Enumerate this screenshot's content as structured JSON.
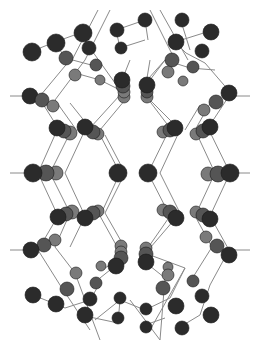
{
  "diagram": {
    "type": "ball-and-stick crystal lattice",
    "width": 255,
    "height": 349,
    "colors": {
      "background": "#ffffff",
      "bond": "#8a8a8a",
      "atom_dark": "#2b2b2b",
      "atom_mid": "#555555",
      "atom_light": "#7a7a7a",
      "atom_stroke": "#1a1a1a"
    },
    "bond_width": 1,
    "bonds": [
      [
        10,
        96,
        38,
        96
      ],
      [
        229,
        96,
        250,
        96
      ],
      [
        10,
        173,
        35,
        173
      ],
      [
        225,
        173,
        250,
        173
      ],
      [
        10,
        250,
        38,
        250
      ],
      [
        229,
        250,
        250,
        250
      ],
      [
        98,
        10,
        72,
        60
      ],
      [
        110,
        10,
        85,
        60
      ],
      [
        150,
        10,
        175,
        60
      ],
      [
        160,
        10,
        188,
        60
      ],
      [
        30,
        52,
        55,
        42
      ],
      [
        55,
        42,
        80,
        33
      ],
      [
        55,
        42,
        65,
        58
      ],
      [
        80,
        33,
        90,
        48
      ],
      [
        65,
        58,
        95,
        66
      ],
      [
        90,
        48,
        120,
        90
      ],
      [
        75,
        73,
        100,
        80
      ],
      [
        100,
        80,
        120,
        90
      ],
      [
        116,
        30,
        145,
        20
      ],
      [
        145,
        20,
        148,
        40
      ],
      [
        116,
        30,
        120,
        48
      ],
      [
        120,
        48,
        145,
        40
      ],
      [
        180,
        18,
        190,
        50
      ],
      [
        175,
        42,
        210,
        31
      ],
      [
        175,
        42,
        186,
        53
      ],
      [
        186,
        53,
        205,
        63
      ],
      [
        205,
        63,
        230,
        92
      ],
      [
        165,
        60,
        190,
        68
      ],
      [
        190,
        68,
        215,
        70
      ],
      [
        165,
        60,
        140,
        88
      ],
      [
        150,
        80,
        165,
        60
      ],
      [
        70,
        60,
        40,
        96
      ],
      [
        85,
        60,
        55,
        100
      ],
      [
        130,
        60,
        118,
        90
      ],
      [
        150,
        60,
        145,
        90
      ],
      [
        38,
        96,
        58,
        128
      ],
      [
        55,
        100,
        75,
        128
      ],
      [
        70,
        103,
        90,
        128
      ],
      [
        120,
        95,
        90,
        128
      ],
      [
        125,
        100,
        100,
        130
      ],
      [
        145,
        95,
        170,
        128
      ],
      [
        150,
        100,
        180,
        130
      ],
      [
        229,
        96,
        208,
        128
      ],
      [
        212,
        100,
        195,
        130
      ],
      [
        200,
        105,
        185,
        130
      ],
      [
        58,
        128,
        38,
        173
      ],
      [
        70,
        133,
        50,
        173
      ],
      [
        85,
        130,
        65,
        173
      ],
      [
        100,
        135,
        120,
        173
      ],
      [
        105,
        135,
        125,
        173
      ],
      [
        170,
        128,
        148,
        173
      ],
      [
        180,
        130,
        160,
        173
      ],
      [
        195,
        130,
        215,
        173
      ],
      [
        208,
        128,
        230,
        173
      ],
      [
        38,
        173,
        58,
        216
      ],
      [
        50,
        173,
        70,
        213
      ],
      [
        65,
        173,
        85,
        216
      ],
      [
        120,
        173,
        100,
        216
      ],
      [
        125,
        173,
        105,
        213
      ],
      [
        148,
        173,
        170,
        216
      ],
      [
        160,
        173,
        180,
        213
      ],
      [
        215,
        173,
        195,
        216
      ],
      [
        230,
        173,
        210,
        216
      ],
      [
        58,
        216,
        38,
        250
      ],
      [
        70,
        213,
        55,
        247
      ],
      [
        85,
        216,
        70,
        247
      ],
      [
        100,
        216,
        120,
        252
      ],
      [
        105,
        213,
        125,
        248
      ],
      [
        170,
        216,
        145,
        252
      ],
      [
        180,
        213,
        150,
        248
      ],
      [
        195,
        216,
        212,
        247
      ],
      [
        210,
        216,
        229,
        250
      ],
      [
        38,
        250,
        60,
        285
      ],
      [
        55,
        247,
        75,
        273
      ],
      [
        120,
        262,
        100,
        278
      ],
      [
        125,
        255,
        105,
        268
      ],
      [
        145,
        262,
        165,
        278
      ],
      [
        150,
        255,
        185,
        268
      ],
      [
        229,
        250,
        210,
        285
      ],
      [
        212,
        247,
        190,
        282
      ],
      [
        33,
        295,
        65,
        308
      ],
      [
        65,
        308,
        90,
        300
      ],
      [
        90,
        300,
        100,
        283
      ],
      [
        85,
        316,
        118,
        323
      ],
      [
        118,
        323,
        120,
        300
      ],
      [
        120,
        300,
        145,
        310
      ],
      [
        145,
        310,
        170,
        298
      ],
      [
        170,
        298,
        185,
        268
      ],
      [
        175,
        330,
        200,
        315
      ],
      [
        200,
        315,
        210,
        285
      ],
      [
        145,
        325,
        165,
        318
      ],
      [
        60,
        285,
        90,
        330
      ],
      [
        75,
        273,
        100,
        340
      ],
      [
        165,
        278,
        160,
        340
      ],
      [
        185,
        268,
        150,
        330
      ],
      [
        95,
        320,
        120,
        300
      ],
      [
        130,
        300,
        160,
        340
      ]
    ],
    "atoms": [
      {
        "x": 32,
        "y": 52,
        "r": 9,
        "shade": "dark"
      },
      {
        "x": 56,
        "y": 43,
        "r": 9,
        "shade": "dark"
      },
      {
        "x": 83,
        "y": 33,
        "r": 9,
        "shade": "dark"
      },
      {
        "x": 66,
        "y": 58,
        "r": 7,
        "shade": "mid"
      },
      {
        "x": 89,
        "y": 48,
        "r": 7,
        "shade": "dark"
      },
      {
        "x": 75,
        "y": 75,
        "r": 6,
        "shade": "light"
      },
      {
        "x": 96,
        "y": 65,
        "r": 6,
        "shade": "mid"
      },
      {
        "x": 100,
        "y": 80,
        "r": 5,
        "shade": "light"
      },
      {
        "x": 117,
        "y": 30,
        "r": 7,
        "shade": "dark"
      },
      {
        "x": 145,
        "y": 20,
        "r": 7,
        "shade": "dark"
      },
      {
        "x": 121,
        "y": 48,
        "r": 6,
        "shade": "dark"
      },
      {
        "x": 182,
        "y": 20,
        "r": 7,
        "shade": "dark"
      },
      {
        "x": 176,
        "y": 42,
        "r": 8,
        "shade": "dark"
      },
      {
        "x": 211,
        "y": 32,
        "r": 8,
        "shade": "dark"
      },
      {
        "x": 202,
        "y": 51,
        "r": 7,
        "shade": "dark"
      },
      {
        "x": 172,
        "y": 60,
        "r": 7,
        "shade": "mid"
      },
      {
        "x": 193,
        "y": 67,
        "r": 6,
        "shade": "mid"
      },
      {
        "x": 168,
        "y": 72,
        "r": 6,
        "shade": "light"
      },
      {
        "x": 183,
        "y": 81,
        "r": 5,
        "shade": "light"
      },
      {
        "x": 30,
        "y": 96,
        "r": 8,
        "shade": "dark"
      },
      {
        "x": 42,
        "y": 100,
        "r": 7,
        "shade": "mid"
      },
      {
        "x": 53,
        "y": 106,
        "r": 6,
        "shade": "light"
      },
      {
        "x": 124,
        "y": 97,
        "r": 6,
        "shade": "light"
      },
      {
        "x": 124,
        "y": 92,
        "r": 6,
        "shade": "light"
      },
      {
        "x": 123,
        "y": 86,
        "r": 7,
        "shade": "mid"
      },
      {
        "x": 122,
        "y": 80,
        "r": 8,
        "shade": "dark"
      },
      {
        "x": 147,
        "y": 97,
        "r": 6,
        "shade": "light"
      },
      {
        "x": 147,
        "y": 92,
        "r": 6,
        "shade": "mid"
      },
      {
        "x": 147,
        "y": 85,
        "r": 8,
        "shade": "dark"
      },
      {
        "x": 204,
        "y": 110,
        "r": 6,
        "shade": "light"
      },
      {
        "x": 216,
        "y": 102,
        "r": 7,
        "shade": "mid"
      },
      {
        "x": 229,
        "y": 93,
        "r": 8,
        "shade": "dark"
      },
      {
        "x": 70,
        "y": 133,
        "r": 7,
        "shade": "light"
      },
      {
        "x": 64,
        "y": 131,
        "r": 7,
        "shade": "mid"
      },
      {
        "x": 57,
        "y": 128,
        "r": 8,
        "shade": "dark"
      },
      {
        "x": 98,
        "y": 134,
        "r": 6,
        "shade": "light"
      },
      {
        "x": 93,
        "y": 132,
        "r": 7,
        "shade": "mid"
      },
      {
        "x": 85,
        "y": 127,
        "r": 8,
        "shade": "dark"
      },
      {
        "x": 163,
        "y": 132,
        "r": 6,
        "shade": "light"
      },
      {
        "x": 170,
        "y": 130,
        "r": 7,
        "shade": "mid"
      },
      {
        "x": 175,
        "y": 128,
        "r": 8,
        "shade": "dark"
      },
      {
        "x": 196,
        "y": 134,
        "r": 6,
        "shade": "light"
      },
      {
        "x": 203,
        "y": 131,
        "r": 7,
        "shade": "mid"
      },
      {
        "x": 210,
        "y": 127,
        "r": 8,
        "shade": "dark"
      },
      {
        "x": 56,
        "y": 173,
        "r": 7,
        "shade": "light"
      },
      {
        "x": 46,
        "y": 173,
        "r": 8,
        "shade": "mid"
      },
      {
        "x": 33,
        "y": 173,
        "r": 9,
        "shade": "dark"
      },
      {
        "x": 118,
        "y": 173,
        "r": 9,
        "shade": "dark"
      },
      {
        "x": 148,
        "y": 173,
        "r": 9,
        "shade": "dark"
      },
      {
        "x": 208,
        "y": 174,
        "r": 7,
        "shade": "light"
      },
      {
        "x": 218,
        "y": 174,
        "r": 8,
        "shade": "mid"
      },
      {
        "x": 230,
        "y": 173,
        "r": 9,
        "shade": "dark"
      },
      {
        "x": 72,
        "y": 212,
        "r": 7,
        "shade": "light"
      },
      {
        "x": 66,
        "y": 214,
        "r": 7,
        "shade": "mid"
      },
      {
        "x": 58,
        "y": 217,
        "r": 8,
        "shade": "dark"
      },
      {
        "x": 98,
        "y": 211,
        "r": 6,
        "shade": "light"
      },
      {
        "x": 93,
        "y": 213,
        "r": 7,
        "shade": "mid"
      },
      {
        "x": 85,
        "y": 218,
        "r": 8,
        "shade": "dark"
      },
      {
        "x": 163,
        "y": 210,
        "r": 6,
        "shade": "light"
      },
      {
        "x": 170,
        "y": 212,
        "r": 7,
        "shade": "mid"
      },
      {
        "x": 176,
        "y": 218,
        "r": 8,
        "shade": "dark"
      },
      {
        "x": 196,
        "y": 212,
        "r": 6,
        "shade": "light"
      },
      {
        "x": 203,
        "y": 215,
        "r": 7,
        "shade": "mid"
      },
      {
        "x": 210,
        "y": 219,
        "r": 8,
        "shade": "dark"
      },
      {
        "x": 55,
        "y": 240,
        "r": 6,
        "shade": "light"
      },
      {
        "x": 44,
        "y": 245,
        "r": 7,
        "shade": "mid"
      },
      {
        "x": 31,
        "y": 250,
        "r": 8,
        "shade": "dark"
      },
      {
        "x": 121,
        "y": 246,
        "r": 6,
        "shade": "light"
      },
      {
        "x": 121,
        "y": 252,
        "r": 6,
        "shade": "light"
      },
      {
        "x": 121,
        "y": 258,
        "r": 7,
        "shade": "mid"
      },
      {
        "x": 116,
        "y": 266,
        "r": 8,
        "shade": "dark"
      },
      {
        "x": 146,
        "y": 248,
        "r": 6,
        "shade": "light"
      },
      {
        "x": 146,
        "y": 254,
        "r": 7,
        "shade": "mid"
      },
      {
        "x": 146,
        "y": 262,
        "r": 8,
        "shade": "dark"
      },
      {
        "x": 206,
        "y": 237,
        "r": 6,
        "shade": "light"
      },
      {
        "x": 217,
        "y": 246,
        "r": 7,
        "shade": "mid"
      },
      {
        "x": 229,
        "y": 255,
        "r": 8,
        "shade": "dark"
      },
      {
        "x": 76,
        "y": 273,
        "r": 6,
        "shade": "light"
      },
      {
        "x": 67,
        "y": 289,
        "r": 7,
        "shade": "mid"
      },
      {
        "x": 96,
        "y": 283,
        "r": 6,
        "shade": "mid"
      },
      {
        "x": 101,
        "y": 266,
        "r": 5,
        "shade": "light"
      },
      {
        "x": 90,
        "y": 299,
        "r": 7,
        "shade": "dark"
      },
      {
        "x": 33,
        "y": 295,
        "r": 8,
        "shade": "dark"
      },
      {
        "x": 56,
        "y": 304,
        "r": 8,
        "shade": "dark"
      },
      {
        "x": 85,
        "y": 315,
        "r": 8,
        "shade": "dark"
      },
      {
        "x": 120,
        "y": 298,
        "r": 6,
        "shade": "dark"
      },
      {
        "x": 118,
        "y": 318,
        "r": 6,
        "shade": "dark"
      },
      {
        "x": 168,
        "y": 267,
        "r": 5,
        "shade": "light"
      },
      {
        "x": 168,
        "y": 275,
        "r": 6,
        "shade": "light"
      },
      {
        "x": 163,
        "y": 288,
        "r": 7,
        "shade": "mid"
      },
      {
        "x": 193,
        "y": 281,
        "r": 6,
        "shade": "mid"
      },
      {
        "x": 176,
        "y": 306,
        "r": 8,
        "shade": "dark"
      },
      {
        "x": 202,
        "y": 296,
        "r": 7,
        "shade": "dark"
      },
      {
        "x": 146,
        "y": 309,
        "r": 6,
        "shade": "dark"
      },
      {
        "x": 146,
        "y": 327,
        "r": 6,
        "shade": "dark"
      },
      {
        "x": 182,
        "y": 328,
        "r": 7,
        "shade": "dark"
      },
      {
        "x": 211,
        "y": 315,
        "r": 8,
        "shade": "dark"
      }
    ]
  }
}
